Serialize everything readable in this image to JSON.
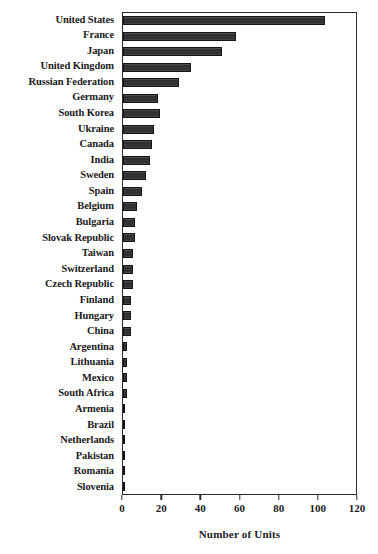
{
  "chart_data": {
    "type": "bar",
    "orientation": "horizontal",
    "title": "",
    "xlabel": "Number of Units",
    "ylabel": "",
    "xlim": [
      0,
      120
    ],
    "xticks": [
      0,
      20,
      40,
      60,
      80,
      100,
      120
    ],
    "grid": false,
    "legend": null,
    "bar_color": "#2e2e2e",
    "axis_color": "#2b2b2b",
    "categories": [
      "United States",
      "France",
      "Japan",
      "United Kingdom",
      "Russian Federation",
      "Germany",
      "South Korea",
      "Ukraine",
      "Canada",
      "India",
      "Sweden",
      "Spain",
      "Belgium",
      "Bulgaria",
      "Slovak Republic",
      "Taiwan",
      "Switzerland",
      "Czech Republic",
      "Finland",
      "Hungary",
      "China",
      "Argentina",
      "Lithuania",
      "Mexico",
      "South Africa",
      "Armenia",
      "Brazil",
      "Netherlands",
      "Pakistan",
      "Romania",
      "Slovenia"
    ],
    "values": [
      104,
      58,
      51,
      35,
      29,
      18,
      19,
      16,
      15,
      14,
      12,
      10,
      7,
      6,
      6,
      5,
      5,
      5,
      4,
      4,
      4,
      2,
      2,
      2,
      2,
      1,
      1,
      1,
      1,
      1,
      1
    ]
  }
}
